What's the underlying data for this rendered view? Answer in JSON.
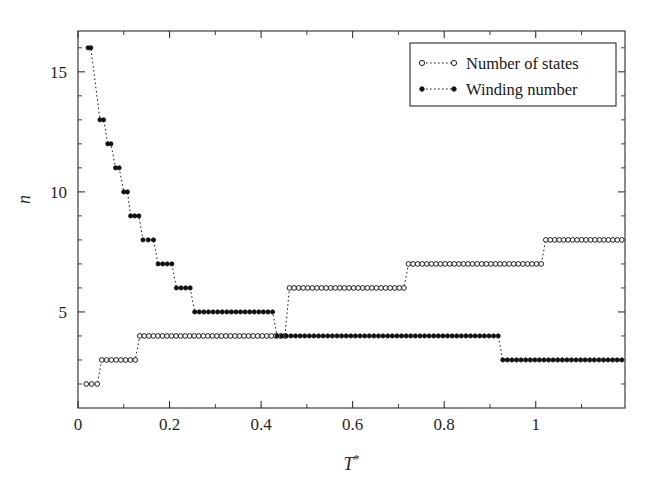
{
  "chart_data": {
    "type": "line",
    "title": "",
    "subtitle": "",
    "xlabel": "T*",
    "xlabel_base": "T",
    "xlabel_sup": "*",
    "ylabel": "n",
    "xlim": [
      0.0,
      1.195
    ],
    "ylim": [
      1.0,
      16.7
    ],
    "grid": false,
    "legend_position": "top-right",
    "xticks": [
      0,
      0.2,
      0.4,
      0.6,
      0.8,
      1
    ],
    "xticklabels": [
      "0",
      "0.2",
      "0.4",
      "0.6",
      "0.8",
      "1"
    ],
    "xminorticks": [
      0.1,
      0.3,
      0.5,
      0.7,
      0.9,
      1.1
    ],
    "yticks": [
      5,
      10,
      15
    ],
    "yticklabels": [
      "5",
      "10",
      "15"
    ],
    "yminorticks": [
      2,
      3,
      4,
      6,
      7,
      8,
      9,
      11,
      12,
      13,
      14,
      16
    ],
    "series": [
      {
        "name": "Number of states",
        "marker": "open-circle",
        "linestyle": "dotted",
        "color": "#141414",
        "steps": [
          {
            "value": 2,
            "x_start": 0.018,
            "x_end": 0.042
          },
          {
            "value": 3,
            "x_start": 0.052,
            "x_end": 0.125
          },
          {
            "value": 4,
            "x_start": 0.135,
            "x_end": 0.455
          },
          {
            "value": 5,
            "x_start": 0.465,
            "x_end": 0.712
          },
          {
            "value": 6,
            "x_start": 0.722,
            "x_end": 1.012
          },
          {
            "value": 7,
            "x_start": 0.722,
            "x_end": 1.012
          },
          {
            "value": 8,
            "x_start": 1.022,
            "x_end": 1.188
          }
        ],
        "plateaus": [
          {
            "value": 2,
            "x_start": 0.018,
            "x_end": 0.042
          },
          {
            "value": 3,
            "x_start": 0.052,
            "x_end": 0.125
          },
          {
            "value": 4,
            "x_start": 0.135,
            "x_end": 0.455
          },
          {
            "value": 5,
            "x_start": 0.465,
            "x_end": 0.712
          },
          {
            "value": 7,
            "x_start": 0.722,
            "x_end": 1.012
          },
          {
            "value": 8,
            "x_start": 1.022,
            "x_end": 1.188
          }
        ],
        "plateaus_extra": [
          {
            "value": 6,
            "x_start": 0.465,
            "x_end": 0.712
          }
        ]
      },
      {
        "name": "Winding number",
        "marker": "filled-circle",
        "linestyle": "dotted",
        "color": "#111111",
        "plateaus": [
          {
            "value": 16,
            "x_start": 0.022,
            "x_end": 0.028
          },
          {
            "value": 13,
            "x_start": 0.048,
            "x_end": 0.056
          },
          {
            "value": 12,
            "x_start": 0.065,
            "x_end": 0.072
          },
          {
            "value": 11,
            "x_start": 0.082,
            "x_end": 0.09
          },
          {
            "value": 10,
            "x_start": 0.1,
            "x_end": 0.108
          },
          {
            "value": 9,
            "x_start": 0.115,
            "x_end": 0.133
          },
          {
            "value": 8,
            "x_start": 0.142,
            "x_end": 0.165
          },
          {
            "value": 7,
            "x_start": 0.175,
            "x_end": 0.205
          },
          {
            "value": 6,
            "x_start": 0.215,
            "x_end": 0.245
          },
          {
            "value": 5,
            "x_start": 0.255,
            "x_end": 0.425
          },
          {
            "value": 4,
            "x_start": 0.435,
            "x_end": 0.918
          },
          {
            "value": 3,
            "x_start": 0.928,
            "x_end": 1.188
          }
        ]
      }
    ]
  },
  "legend": {
    "entries": [
      {
        "label": "Number of states",
        "marker": "open-circle"
      },
      {
        "label": "Winding number",
        "marker": "filled-circle"
      }
    ]
  },
  "axes": {
    "x_label_text": "T",
    "x_label_superscript": "*",
    "y_label_text": "n"
  }
}
